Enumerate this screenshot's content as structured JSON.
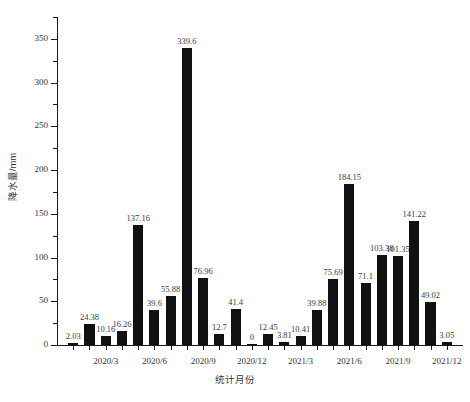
{
  "chart_data": {
    "type": "bar",
    "title": "",
    "xlabel": "统计月份",
    "ylabel": "降水量/mm",
    "ylim": [
      0,
      375
    ],
    "y_major_ticks": [
      0,
      50,
      100,
      150,
      200,
      250,
      300,
      350
    ],
    "y_major_tick_labels": [
      "0",
      "50",
      "100",
      "150",
      "200",
      "250",
      "300",
      "350"
    ],
    "y_minor_ticks": [
      25,
      75,
      125,
      175,
      225,
      275,
      325,
      375
    ],
    "grid": false,
    "legend": null,
    "bar_color": "#111111",
    "categories": [
      "2020/1",
      "2020/2",
      "2020/3",
      "2020/4",
      "2020/5",
      "2020/6",
      "2020/7",
      "2020/8",
      "2020/9",
      "2020/10",
      "2020/11",
      "2020/12",
      "2021/1",
      "2021/2",
      "2021/3",
      "2021/4",
      "2021/5",
      "2021/6",
      "2021/7",
      "2021/8",
      "2021/9",
      "2021/10",
      "2021/11",
      "2021/12"
    ],
    "values": [
      2.03,
      24.38,
      10.16,
      16.26,
      137.16,
      39.6,
      55.88,
      339.6,
      76.96,
      12.7,
      41.4,
      0,
      12.45,
      3.81,
      10.41,
      39.88,
      75.69,
      184.15,
      71.1,
      103.38,
      101.35,
      141.22,
      49.02,
      3.05
    ],
    "value_labels": [
      "2.03",
      "24.38",
      "10.16",
      "16.26",
      "137.16",
      "39.6",
      "55.88",
      "339.6",
      "76.96",
      "12.7",
      "41.4",
      "0",
      "12.45",
      "3.81",
      "10.41",
      "39.88",
      "75.69",
      "184.15",
      "71.1",
      "103.38",
      "101.35",
      "141.22",
      "49.02",
      "3.05"
    ],
    "x_tick_labels": [
      "2020/3",
      "2020/6",
      "2020/9",
      "2020/12",
      "2021/3",
      "2021/6",
      "2021/9",
      "2021/12"
    ],
    "x_tick_category_indices": [
      2,
      5,
      8,
      11,
      14,
      17,
      20,
      23
    ]
  }
}
